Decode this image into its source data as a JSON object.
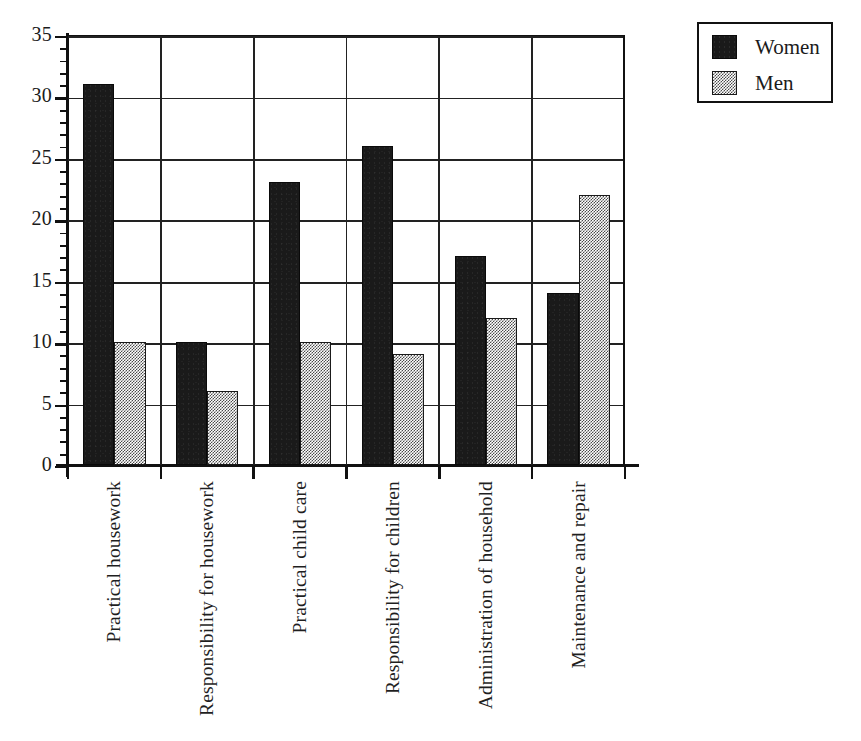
{
  "chart_data": {
    "type": "bar",
    "title": "",
    "subtitle": "",
    "xlabel": "",
    "ylabel": "",
    "grid": true,
    "legend_position": "top-right",
    "ylim": [
      0,
      35
    ],
    "ytick_major_step": 5,
    "ytick_minor_step": 1,
    "ytick_labels": [
      "0",
      "5",
      "10",
      "15",
      "20",
      "25",
      "30",
      "35"
    ],
    "ytick_values": [
      0,
      5,
      10,
      15,
      20,
      25,
      30,
      35
    ],
    "categories": [
      "Practical housework",
      "Responsibility for housework",
      "Practical child care",
      "Responsibility for children",
      "Administration of household",
      "Maintenance and repair"
    ],
    "series": [
      {
        "name": "Women",
        "values": [
          31,
          10,
          23,
          26,
          17,
          14
        ],
        "color": "#1a1a1a",
        "pattern": "solid-black"
      },
      {
        "name": "Men",
        "values": [
          10,
          6,
          10,
          9,
          12,
          22
        ],
        "color": "#bdbdbd",
        "pattern": "checkerboard-stipple"
      }
    ]
  },
  "legend": {
    "entries": [
      {
        "label": "Women",
        "swatch": "solid-black-swatch"
      },
      {
        "label": "Men",
        "swatch": "stipple-swatch"
      }
    ]
  },
  "caption": {
    "text": ""
  }
}
